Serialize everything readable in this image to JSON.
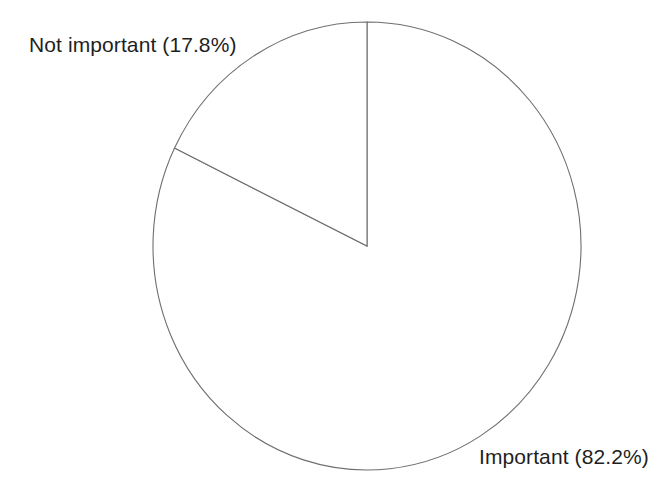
{
  "chart_data": {
    "type": "pie",
    "title": "",
    "subtitle": "",
    "xlabel": "",
    "ylabel": "",
    "grid": false,
    "legend_position": "none",
    "label_format": "{name} ({value}%)",
    "start_angle_deg": 90,
    "direction": "clockwise",
    "units": "percent",
    "total": 100.0,
    "categories": [
      "Important",
      "Not important"
    ],
    "values": [
      82.2,
      17.8
    ],
    "slices": [
      {
        "name": "Important",
        "value": 82.2,
        "label": "Important (82.2%)",
        "fill": "#ffffff",
        "stroke": "#6f6f6f",
        "angle_deg": 295.9,
        "label_position": "bottom-right"
      },
      {
        "name": "Not important",
        "value": 17.8,
        "label": "Not important (17.8%)",
        "fill": "#ffffff",
        "stroke": "#6f6f6f",
        "angle_deg": 64.1,
        "label_position": "top-left"
      }
    ]
  },
  "geometry": {
    "center_x": 367,
    "center_y": 246,
    "radius_x": 214,
    "radius_y": 224
  },
  "style": {
    "background": "#ffffff",
    "line_color": "#6f6f6f",
    "text_color": "#1f1f1f"
  }
}
